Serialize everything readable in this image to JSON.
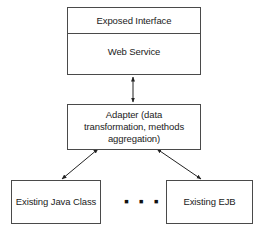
{
  "diagram": {
    "top_box": {
      "header": "Exposed Interface",
      "body": "Web Service"
    },
    "adapter_box": {
      "label": "Adapter (data transformation, methods aggregation)"
    },
    "bottom_boxes": [
      {
        "label": "Existing Java Class"
      },
      {
        "label": "Existing EJB"
      }
    ],
    "ellipsis": "▪ ▪ ▪",
    "connectors": [
      {
        "from": "Web Service",
        "to": "Adapter (data transformation, methods aggregation)",
        "type": "bidirectional-arrow"
      },
      {
        "from": "Adapter (data transformation, methods aggregation)",
        "to": "Existing Java Class",
        "type": "bidirectional-arrow"
      },
      {
        "from": "Adapter (data transformation, methods aggregation)",
        "to": "Existing EJB",
        "type": "bidirectional-arrow"
      }
    ],
    "colors": {
      "stroke": "#4a4a4a",
      "text": "#222222",
      "background": "#ffffff"
    }
  }
}
